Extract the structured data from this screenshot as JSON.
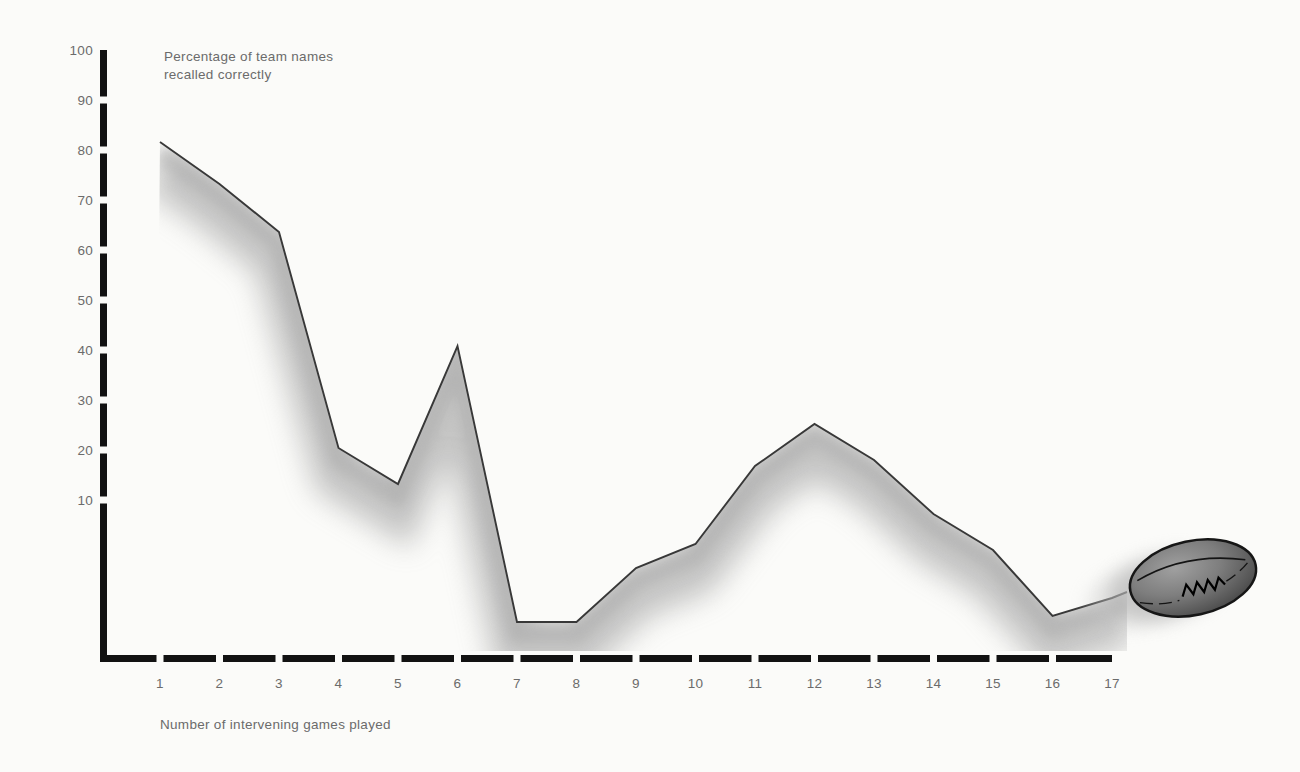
{
  "chart_data": {
    "type": "line",
    "title": "Percentage of team names recalled correctly",
    "title_lines": [
      "Percentage of team names",
      "recalled correctly"
    ],
    "xlabel": "Number of intervening games played",
    "ylabel": "Percentage of team names recalled correctly",
    "x": [
      1,
      2,
      3,
      4,
      5,
      6,
      7,
      8,
      9,
      10,
      11,
      12,
      13,
      14,
      15,
      16,
      17
    ],
    "values": [
      86,
      79,
      71,
      35,
      29,
      52,
      6,
      6,
      15,
      19,
      32,
      39,
      33,
      24,
      18,
      7,
      10
    ],
    "x_ticks": [
      "1",
      "2",
      "3",
      "4",
      "5",
      "6",
      "7",
      "8",
      "9",
      "10",
      "11",
      "12",
      "13",
      "14",
      "15",
      "16",
      "17"
    ],
    "y_ticks": [
      "10",
      "20",
      "30",
      "40",
      "50",
      "60",
      "70",
      "80",
      "90",
      "100"
    ],
    "ylim": [
      0,
      100
    ],
    "xlim": [
      0,
      17
    ],
    "grid": false,
    "legend": null,
    "style": "single dark line with airbrushed gray shadow below; dashed heavy black axes",
    "annotations": [
      {
        "type": "rugby-ball",
        "x": 17,
        "note": "hand-drawn rugby ball with motion-blur trail at the end of the line"
      }
    ]
  },
  "colors": {
    "background": "#fbfbf9",
    "axis": "#121212",
    "tick_text": "#6b6b6b",
    "curve": "#383838",
    "shadow": "#a9a9a9",
    "ball_outline": "#161616",
    "ball_light": "#a0a0a0",
    "ball_dark": "#3e3e3e"
  }
}
